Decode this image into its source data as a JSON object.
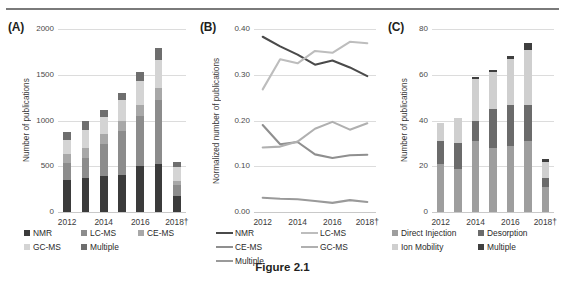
{
  "caption": "Figure 2.1",
  "panels": {
    "a": {
      "tag": "(A)",
      "ylabel": "Number of publications",
      "yticks": [
        "2000",
        "1500",
        "1000",
        "500",
        "0"
      ],
      "xticks": [
        "2012",
        "2014",
        "2016",
        "2018†"
      ],
      "legend": [
        {
          "label": "NMR",
          "color": "#3b3b3b"
        },
        {
          "label": "LC-MS",
          "color": "#8c8c8c"
        },
        {
          "label": "CE-MS",
          "color": "#a8a8a8"
        },
        {
          "label": "GC-MS",
          "color": "#d4d4d4"
        },
        {
          "label": "Multiple",
          "color": "#6e6e6e"
        }
      ]
    },
    "b": {
      "tag": "(B)",
      "ylabel": "Normalized number of publications",
      "yticks": [
        "0.40",
        "0.30",
        "0.20",
        "0.10",
        "0.00"
      ],
      "xticks": [
        "2012",
        "2014",
        "2016",
        "2018†"
      ],
      "legend": [
        {
          "label": "NMR",
          "color": "#4a4a4a"
        },
        {
          "label": "LC-MS",
          "color": "#bdbdbd"
        },
        {
          "label": "CE-MS",
          "color": "#8f8f8f"
        },
        {
          "label": "GC-MS",
          "color": "#b0b0b0"
        },
        {
          "label": "Multiple",
          "color": "#9a9a9a"
        }
      ]
    },
    "c": {
      "tag": "(C)",
      "ylabel": "Number of publications",
      "yticks": [
        "80",
        "60",
        "40",
        "20",
        "0"
      ],
      "xticks": [
        "2012",
        "2014",
        "2016",
        "2018†"
      ],
      "legend": [
        {
          "label": "Direct Injection",
          "color": "#9e9e9e"
        },
        {
          "label": "Desorption",
          "color": "#6b6b6b"
        },
        {
          "label": "Ion Mobility",
          "color": "#cfcfcf"
        },
        {
          "label": "Multiple",
          "color": "#3f3f3f"
        }
      ]
    }
  },
  "chart_data": [
    {
      "type": "bar",
      "panel": "A",
      "title": "",
      "xlabel": "",
      "ylabel": "Number of publications",
      "ylim": [
        0,
        2000
      ],
      "ytick_values": [
        0,
        500,
        1000,
        1500,
        2000
      ],
      "grid": true,
      "stacked": true,
      "legend": "bottom",
      "categories": [
        "2012",
        "2013",
        "2014",
        "2015",
        "2016",
        "2017",
        "2018†"
      ],
      "series": [
        {
          "name": "NMR",
          "color": "#3b3b3b",
          "values": [
            345,
            370,
            390,
            405,
            500,
            530,
            175
          ]
        },
        {
          "name": "LC-MS",
          "color": "#8c8c8c",
          "values": [
            195,
            225,
            355,
            480,
            545,
            690,
            125
          ]
        },
        {
          "name": "CE-MS",
          "color": "#a8a8a8",
          "values": [
            90,
            110,
            105,
            110,
            120,
            135,
            40
          ]
        },
        {
          "name": "GC-MS",
          "color": "#d4d4d4",
          "values": [
            160,
            195,
            185,
            225,
            270,
            310,
            155
          ]
        },
        {
          "name": "Multiple",
          "color": "#6e6e6e",
          "values": [
            80,
            95,
            75,
            85,
            100,
            130,
            50
          ]
        }
      ],
      "totals": [
        870,
        995,
        1110,
        1305,
        1535,
        1795,
        545
      ]
    },
    {
      "type": "line",
      "panel": "B",
      "title": "",
      "xlabel": "",
      "ylabel": "Normalized number of publications",
      "ylim": [
        0.0,
        0.4
      ],
      "ytick_values": [
        0.0,
        0.1,
        0.2,
        0.3,
        0.4
      ],
      "grid": true,
      "legend": "bottom",
      "x": [
        "2012",
        "2013",
        "2014",
        "2015",
        "2016",
        "2017",
        "2018†"
      ],
      "series": [
        {
          "name": "NMR",
          "color": "#4a4a4a",
          "values": [
            0.383,
            0.362,
            0.344,
            0.322,
            0.331,
            0.316,
            0.297
          ]
        },
        {
          "name": "LC-MS",
          "color": "#bdbdbd",
          "values": [
            0.268,
            0.334,
            0.325,
            0.352,
            0.348,
            0.372,
            0.369
          ]
        },
        {
          "name": "CE-MS",
          "color": "#8f8f8f",
          "values": [
            0.19,
            0.148,
            0.153,
            0.126,
            0.118,
            0.124,
            0.125
          ]
        },
        {
          "name": "GC-MS",
          "color": "#b0b0b0",
          "values": [
            0.141,
            0.143,
            0.154,
            0.182,
            0.197,
            0.18,
            0.194
          ]
        },
        {
          "name": "Multiple",
          "color": "#9a9a9a",
          "values": [
            0.031,
            0.029,
            0.028,
            0.024,
            0.02,
            0.026,
            0.022
          ]
        }
      ]
    },
    {
      "type": "bar",
      "panel": "C",
      "title": "",
      "xlabel": "",
      "ylabel": "Number of publications",
      "ylim": [
        0,
        80
      ],
      "ytick_values": [
        0,
        20,
        40,
        60,
        80
      ],
      "grid": true,
      "stacked": true,
      "legend": "bottom",
      "categories": [
        "2012",
        "2013",
        "2014",
        "2015",
        "2016",
        "2017",
        "2018†"
      ],
      "series": [
        {
          "name": "Direct Injection",
          "color": "#9e9e9e",
          "values": [
            21,
            19,
            31,
            28,
            29,
            31,
            11
          ]
        },
        {
          "name": "Desorption",
          "color": "#6b6b6b",
          "values": [
            10,
            11,
            9,
            17,
            18,
            16,
            4
          ]
        },
        {
          "name": "Ion Mobility",
          "color": "#cfcfcf",
          "values": [
            8,
            11,
            18,
            16,
            20,
            24,
            7
          ]
        },
        {
          "name": "Multiple",
          "color": "#3f3f3f",
          "values": [
            0,
            0,
            1,
            1,
            1,
            3,
            1
          ]
        }
      ],
      "totals": [
        39,
        41,
        59,
        62,
        68,
        74,
        23
      ]
    }
  ]
}
